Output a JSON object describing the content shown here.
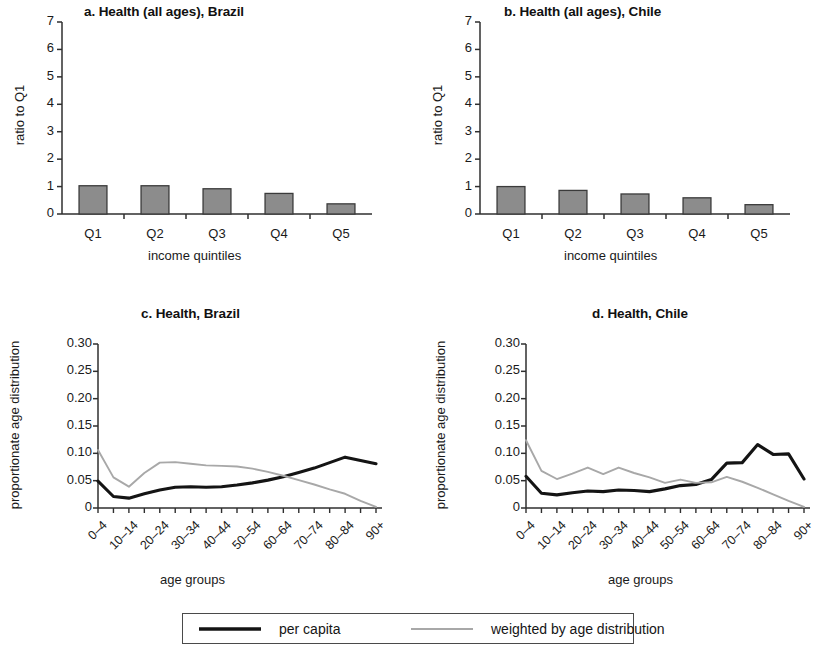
{
  "figure": {
    "legend": {
      "items": [
        {
          "label": "per capita",
          "style": "solid-thick",
          "color": "#141414"
        },
        {
          "label": "weighted by age distribution",
          "style": "solid-thin",
          "color": "#a8a8a8"
        }
      ]
    }
  },
  "chart_data": [
    {
      "type": "bar",
      "panel": "a",
      "title": "a. Health (all ages), Brazil",
      "xlabel": "income quintiles",
      "ylabel": "ratio to Q1",
      "categories": [
        "Q1",
        "Q2",
        "Q3",
        "Q4",
        "Q5"
      ],
      "values": [
        1.03,
        1.03,
        0.92,
        0.75,
        0.37
      ],
      "ylim": [
        0,
        7
      ],
      "yticks": [
        0,
        1,
        2,
        3,
        4,
        5,
        6,
        7
      ],
      "ytick_labels": [
        "0",
        "1",
        "2",
        "3",
        "4",
        "5",
        "6",
        "7"
      ],
      "grid": false,
      "bar_fill": "#8c8c8c",
      "bar_stroke": "#3b3b3b"
    },
    {
      "type": "bar",
      "panel": "b",
      "title": "b. Health (all ages), Chile",
      "xlabel": "income quintiles",
      "ylabel": "ratio to Q1",
      "categories": [
        "Q1",
        "Q2",
        "Q3",
        "Q4",
        "Q5"
      ],
      "values": [
        1.0,
        0.86,
        0.73,
        0.59,
        0.34
      ],
      "ylim": [
        0,
        7
      ],
      "yticks": [
        0,
        1,
        2,
        3,
        4,
        5,
        6,
        7
      ],
      "ytick_labels": [
        "0",
        "1",
        "2",
        "3",
        "4",
        "5",
        "6",
        "7"
      ],
      "grid": false,
      "bar_fill": "#8c8c8c",
      "bar_stroke": "#3b3b3b"
    },
    {
      "type": "line",
      "panel": "c",
      "title": "c. Health, Brazil",
      "xlabel": "age groups",
      "ylabel": "proportionate age distribution",
      "categories": [
        "0–4",
        "5–9",
        "10–14",
        "15–19",
        "20–24",
        "25–29",
        "30–34",
        "35–39",
        "40–44",
        "45–49",
        "50–54",
        "55–59",
        "60–64",
        "65–69",
        "70–74",
        "75–79",
        "80–84",
        "85–89",
        "90+"
      ],
      "tick_labels_shown": [
        "0–4",
        "10–14",
        "20–24",
        "30–34",
        "40–44",
        "50–54",
        "60–64",
        "70–74",
        "80–84",
        "90+"
      ],
      "series": [
        {
          "name": "per capita",
          "color": "#141414",
          "values": [
            0.049,
            0.021,
            0.018,
            0.026,
            0.033,
            0.038,
            0.039,
            0.038,
            0.039,
            0.042,
            0.046,
            0.051,
            0.057,
            0.065,
            0.073,
            0.083,
            0.093,
            0.087,
            0.081
          ]
        },
        {
          "name": "weighted by age distribution",
          "color": "#a8a8a8",
          "values": [
            0.106,
            0.056,
            0.039,
            0.064,
            0.083,
            0.084,
            0.081,
            0.078,
            0.077,
            0.076,
            0.072,
            0.066,
            0.059,
            0.051,
            0.043,
            0.034,
            0.026,
            0.013,
            0.002
          ]
        }
      ],
      "ylim": [
        0,
        0.3
      ],
      "yticks": [
        0,
        0.05,
        0.1,
        0.15,
        0.2,
        0.25,
        0.3
      ],
      "ytick_labels": [
        "0",
        "0.05",
        "0.10",
        "0.15",
        "0.20",
        "0.25",
        "0.30"
      ],
      "grid": false
    },
    {
      "type": "line",
      "panel": "d",
      "title": "d. Health, Chile",
      "xlabel": "age groups",
      "ylabel": "proportionate age distribution",
      "categories": [
        "0–4",
        "5–9",
        "10–14",
        "15–19",
        "20–24",
        "25–29",
        "30–34",
        "35–39",
        "40–44",
        "45–49",
        "50–54",
        "55–59",
        "60–64",
        "65–69",
        "70–74",
        "75–79",
        "80–84",
        "85–89",
        "90+"
      ],
      "tick_labels_shown": [
        "0–4",
        "10–14",
        "20–24",
        "30–34",
        "40–44",
        "50–54",
        "60–64",
        "70–74",
        "80–84",
        "90+"
      ],
      "series": [
        {
          "name": "per capita",
          "color": "#141414",
          "values": [
            0.058,
            0.027,
            0.024,
            0.028,
            0.031,
            0.03,
            0.033,
            0.032,
            0.03,
            0.035,
            0.041,
            0.043,
            0.052,
            0.082,
            0.083,
            0.116,
            0.098,
            0.099,
            0.053
          ]
        },
        {
          "name": "weighted by age distribution",
          "color": "#a8a8a8",
          "values": [
            0.124,
            0.068,
            0.053,
            0.063,
            0.074,
            0.062,
            0.074,
            0.064,
            0.056,
            0.046,
            0.052,
            0.046,
            0.047,
            0.057,
            0.048,
            0.037,
            0.025,
            0.013,
            0.002
          ]
        }
      ],
      "ylim": [
        0,
        0.3
      ],
      "yticks": [
        0,
        0.05,
        0.1,
        0.15,
        0.2,
        0.25,
        0.3
      ],
      "ytick_labels": [
        "0",
        "0.05",
        "0.10",
        "0.15",
        "0.20",
        "0.25",
        "0.30"
      ],
      "grid": false
    }
  ]
}
